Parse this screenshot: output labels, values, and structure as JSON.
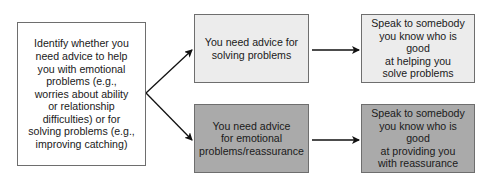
{
  "diagram": {
    "type": "flowchart",
    "nodes": {
      "start": {
        "lines": [
          "Identify whether you",
          "need advice to help",
          "you with emotional",
          "problems (e.g.,",
          "worries about ability",
          "or relationship",
          "difficulties) or for",
          "solving problems (e.g.,",
          "improving catching)"
        ]
      },
      "solving": {
        "lines": [
          "You need advice for",
          "solving problems"
        ]
      },
      "emotional": {
        "lines": [
          "You need advice",
          "for emotional",
          "problems/reassurance"
        ]
      },
      "speak_solve": {
        "lines": [
          "Speak to somebody",
          "you know who is good",
          "at helping you",
          "solve problems"
        ]
      },
      "speak_reassure": {
        "lines": [
          "Speak to somebody",
          "you know who is good",
          "at providing you",
          "with reassurance"
        ]
      }
    },
    "edges": [
      {
        "from": "start",
        "to": "solving"
      },
      {
        "from": "start",
        "to": "emotional"
      },
      {
        "from": "solving",
        "to": "speak_solve"
      },
      {
        "from": "emotional",
        "to": "speak_reassure"
      }
    ],
    "colors": {
      "light_box": "#ececec",
      "dark_box": "#aaaaaa",
      "border": "#6e6e6e",
      "arrow": "#111111"
    }
  }
}
